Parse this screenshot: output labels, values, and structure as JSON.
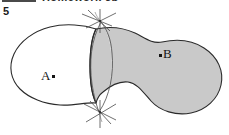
{
  "page": {
    "width": 229,
    "height": 135,
    "background": "#ffffff"
  },
  "header": {
    "rule_present": true,
    "title": "Homework 5b",
    "note": "top header line is clipped by the top edge of the scan"
  },
  "problem": {
    "number": "5"
  },
  "figure": {
    "type": "set-diagram",
    "caption_text": "",
    "colors": {
      "region_a_fill": "#ffffff",
      "region_b_fill": "#c9c9c9",
      "outline": "#2a2a2a",
      "construction_line": "#555555",
      "label_color": "#141414"
    },
    "regions": [
      {
        "id": "region-a",
        "label": "A.",
        "label_text": "A",
        "point_marker": true,
        "fill": "white",
        "description": "left unshaded blob region"
      },
      {
        "id": "region-b",
        "label": ".B",
        "label_text": "B",
        "point_marker": true,
        "fill": "gray",
        "description": "right shaded blob region"
      }
    ],
    "construction": {
      "arc_count": 2,
      "intersection_count": 2,
      "tick_marks_per_intersection": 4,
      "description": "compass construction arcs crossing at two points, forming a lens between the two regions"
    },
    "labels": {
      "a": "A.",
      "b": ".B"
    }
  }
}
